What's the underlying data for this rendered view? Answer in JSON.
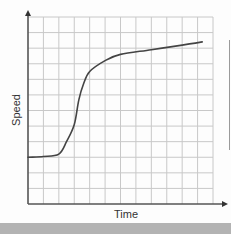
{
  "chart_data": {
    "type": "line",
    "title": "",
    "xlabel": "Time",
    "ylabel": "Speed",
    "x_ticks_labeled": false,
    "y_ticks_labeled": false,
    "grid": true,
    "grid_columns": 12,
    "grid_rows": 12,
    "xlim": [
      0,
      12
    ],
    "ylim": [
      0,
      12
    ],
    "legend": null,
    "series": [
      {
        "name": "Speed vs Time",
        "color": "#444444",
        "x": [
          0,
          1,
          2,
          2.5,
          3,
          3.3,
          3.6,
          4,
          5,
          6,
          8,
          10,
          11.3
        ],
        "y": [
          3.0,
          3.05,
          3.2,
          4.0,
          5.1,
          6.7,
          7.7,
          8.5,
          9.2,
          9.6,
          9.9,
          10.2,
          10.4
        ]
      }
    ]
  },
  "colors": {
    "grid": "#c8c8c8",
    "axis": "#555555",
    "curve": "#444444",
    "background": "#fdfdfd",
    "bottom_band": "#b3b3b3"
  }
}
